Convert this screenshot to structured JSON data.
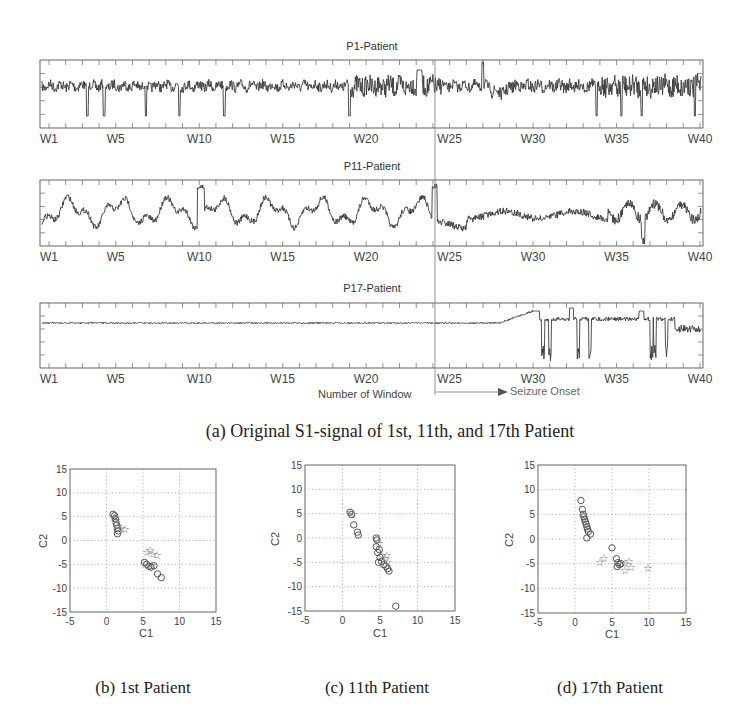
{
  "figure": {
    "caption_a": "(a) Original S1-signal of 1st, 11th, and 17th Patient",
    "caption_b": "(b) 1st Patient",
    "caption_c": "(c) 11th Patient",
    "caption_d": "(d) 17th Patient",
    "xlabel_signals": "Number of Window",
    "seizure_label": "Seizure Onset",
    "seizure_window": "W24",
    "window_ticks": [
      "W1",
      "W5",
      "W10",
      "W15",
      "W20",
      "W25",
      "W30",
      "W35",
      "W40"
    ]
  },
  "chart_data": [
    {
      "type": "line",
      "title": "P1-Patient",
      "xlabel": "Number of Window",
      "x_categories": [
        "W1",
        "W5",
        "W10",
        "W15",
        "W20",
        "W25",
        "W30",
        "W35",
        "W40"
      ],
      "description": "EEG S1 signal: moderate-amplitude irregular activity with sharp negative spikes (~W3, W4, W7, W19); large deflections near W22–W24 and W27; dense higher-frequency activity from ~W28 to W34; larger spiky oscillations W34–W40",
      "annotation": {
        "vertical_line_at": "W24",
        "label": "Seizure Onset"
      },
      "grid": false
    },
    {
      "type": "line",
      "title": "P11-Patient",
      "xlabel": "Number of Window",
      "x_categories": [
        "W1",
        "W5",
        "W10",
        "W15",
        "W20",
        "W25",
        "W30",
        "W35",
        "W40"
      ],
      "description": "EEG S1 signal: large slow oscillations throughout W1–W24 with peak near W10; after W24 a dip then dense moderate activity W25–W34; large negative spikes around W36–W37",
      "annotation": {
        "vertical_line_at": "W24",
        "label": "Seizure Onset"
      },
      "grid": false
    },
    {
      "type": "line",
      "title": "P17-Patient",
      "xlabel": "Number of Window",
      "x_categories": [
        "W1",
        "W5",
        "W10",
        "W15",
        "W20",
        "W25",
        "W30",
        "W35",
        "W40"
      ],
      "description": "EEG S1 signal: nearly flat from W1 to ~W28; gradual rise to peak near W30; then erratic step-like activity with sharp negative spikes around W30–W31, W33, W37 and W38",
      "annotation": {
        "vertical_line_at": "W24",
        "label": "Seizure Onset",
        "arrow": "right"
      },
      "grid": false
    },
    {
      "type": "scatter",
      "title": "(b) 1st Patient",
      "xlabel": "C1",
      "ylabel": "C2",
      "xlim": [
        -5,
        15
      ],
      "ylim": [
        -15,
        15
      ],
      "xticks": [
        -5,
        0,
        5,
        10,
        15
      ],
      "yticks": [
        -15,
        -10,
        -5,
        0,
        5,
        10,
        15
      ],
      "grid": true,
      "series": [
        {
          "name": "circles (o)",
          "marker": "o",
          "points": [
            [
              0.9,
              5.5
            ],
            [
              1.1,
              5.2
            ],
            [
              1.2,
              4.6
            ],
            [
              1.3,
              3.8
            ],
            [
              1.4,
              3.2
            ],
            [
              1.5,
              2.5
            ],
            [
              1.6,
              2.0
            ],
            [
              1.5,
              1.4
            ],
            [
              5.2,
              -4.6
            ],
            [
              5.5,
              -5.0
            ],
            [
              5.8,
              -5.4
            ],
            [
              6.1,
              -5.6
            ],
            [
              6.5,
              -5.3
            ],
            [
              7.0,
              -7.0
            ],
            [
              7.5,
              -7.8
            ]
          ]
        },
        {
          "name": "stars (*)",
          "marker": "*",
          "points": [
            [
              1.0,
              5.0
            ],
            [
              1.3,
              4.2
            ],
            [
              1.6,
              3.0
            ],
            [
              2.0,
              2.6
            ],
            [
              2.6,
              2.5
            ],
            [
              5.6,
              -2.5
            ],
            [
              6.0,
              -2.0
            ],
            [
              6.4,
              -2.8
            ],
            [
              6.9,
              -3.0
            ],
            [
              5.4,
              -4.8
            ],
            [
              6.2,
              -5.2
            ]
          ]
        }
      ]
    },
    {
      "type": "scatter",
      "title": "(c) 11th Patient",
      "xlabel": "C1",
      "ylabel": "C2",
      "xlim": [
        -5,
        15
      ],
      "ylim": [
        -15,
        15
      ],
      "xticks": [
        -5,
        0,
        5,
        10,
        15
      ],
      "yticks": [
        -15,
        -10,
        -5,
        0,
        5,
        10,
        15
      ],
      "grid": true,
      "series": [
        {
          "name": "circles (o)",
          "marker": "o",
          "points": [
            [
              1.0,
              5.3
            ],
            [
              1.2,
              4.8
            ],
            [
              1.5,
              2.7
            ],
            [
              2.0,
              1.2
            ],
            [
              2.1,
              0.6
            ],
            [
              4.5,
              0.0
            ],
            [
              4.6,
              -0.4
            ],
            [
              4.5,
              -1.8
            ],
            [
              4.7,
              -3.0
            ],
            [
              4.9,
              -2.4
            ],
            [
              5.0,
              -4.0
            ],
            [
              4.8,
              -5.0
            ],
            [
              5.2,
              -4.8
            ],
            [
              5.5,
              -5.5
            ],
            [
              5.8,
              -5.8
            ],
            [
              6.0,
              -6.3
            ],
            [
              6.2,
              -6.8
            ],
            [
              7.1,
              -14.0
            ]
          ]
        },
        {
          "name": "stars (*)",
          "marker": "*",
          "points": [
            [
              1.1,
              5.4
            ],
            [
              1.4,
              5.0
            ],
            [
              4.8,
              -1.0
            ],
            [
              5.3,
              -3.5
            ],
            [
              5.7,
              -4.2
            ],
            [
              5.9,
              -3.4
            ],
            [
              6.1,
              -5.0
            ]
          ]
        }
      ]
    },
    {
      "type": "scatter",
      "title": "(d) 17th Patient",
      "xlabel": "C1",
      "ylabel": "C2",
      "xlim": [
        -5,
        15
      ],
      "ylim": [
        -15,
        15
      ],
      "xticks": [
        -5,
        0,
        5,
        10,
        15
      ],
      "yticks": [
        -15,
        -10,
        -5,
        0,
        5,
        10,
        15
      ],
      "grid": true,
      "series": [
        {
          "name": "circles (o)",
          "marker": "o",
          "points": [
            [
              0.8,
              7.8
            ],
            [
              1.0,
              6.0
            ],
            [
              1.1,
              5.0
            ],
            [
              1.2,
              4.5
            ],
            [
              1.3,
              4.0
            ],
            [
              1.4,
              3.5
            ],
            [
              1.5,
              3.0
            ],
            [
              1.6,
              2.5
            ],
            [
              1.7,
              2.0
            ],
            [
              1.8,
              1.5
            ],
            [
              2.1,
              1.0
            ],
            [
              1.6,
              0.2
            ],
            [
              5.0,
              -1.8
            ],
            [
              5.6,
              -4.0
            ],
            [
              5.8,
              -4.8
            ],
            [
              6.0,
              -5.2
            ],
            [
              5.7,
              -5.6
            ],
            [
              6.2,
              -5.0
            ]
          ]
        },
        {
          "name": "stars (*)",
          "marker": "*",
          "points": [
            [
              3.4,
              -4.6
            ],
            [
              3.9,
              -3.8
            ],
            [
              6.8,
              -4.8
            ],
            [
              7.3,
              -4.4
            ],
            [
              7.6,
              -5.6
            ],
            [
              6.8,
              -6.3
            ],
            [
              9.9,
              -5.9
            ]
          ]
        }
      ]
    }
  ]
}
